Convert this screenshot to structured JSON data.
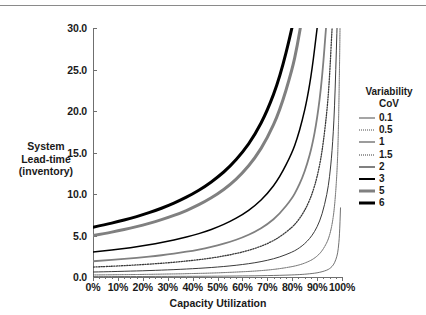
{
  "chart_data": {
    "type": "line",
    "title": "",
    "xlabel": "Capacity Utilization",
    "ylabel": "System Lead-time (inventory)",
    "ylabel_lines": [
      "System",
      "Lead-time",
      "(inventory)"
    ],
    "xlim": [
      0,
      100
    ],
    "ylim": [
      0,
      30
    ],
    "grid": false,
    "legend_position": "right",
    "legend_title_lines": [
      "Variability",
      "CoV"
    ],
    "x_tick_labels": [
      "0%",
      "10%",
      "20%",
      "30%",
      "40%",
      "50%",
      "60%",
      "70%",
      "80%",
      "90%",
      "100%"
    ],
    "x_tick_values": [
      0,
      10,
      20,
      30,
      40,
      50,
      60,
      70,
      80,
      90,
      100
    ],
    "y_tick_labels": [
      "0.0",
      "5.0",
      "10.0",
      "15.0",
      "20.0",
      "25.0",
      "30.0"
    ],
    "y_tick_values": [
      0,
      5,
      10,
      15,
      20,
      25,
      30
    ],
    "x": [
      0,
      5,
      10,
      15,
      20,
      25,
      30,
      35,
      40,
      45,
      50,
      55,
      60,
      65,
      70,
      75,
      80,
      82,
      84,
      86,
      88,
      90,
      92,
      94,
      95,
      96,
      97,
      98,
      98.5,
      99,
      99.4
    ],
    "series": [
      {
        "name": "0.1",
        "label": "0.1",
        "color": "#4d4d4d",
        "width": 0.8,
        "dash": "none",
        "intercept": 0.05,
        "values": [
          0.05,
          0.05,
          0.06,
          0.06,
          0.06,
          0.07,
          0.07,
          0.08,
          0.08,
          0.09,
          0.1,
          0.11,
          0.13,
          0.14,
          0.17,
          0.2,
          0.25,
          0.28,
          0.31,
          0.36,
          0.42,
          0.5,
          0.63,
          0.83,
          1.0,
          1.25,
          1.67,
          2.5,
          3.33,
          5.0,
          8.33
        ]
      },
      {
        "name": "0.5",
        "label": "0.5",
        "color": "#4d4d4d",
        "width": 0.9,
        "dash": "dotted",
        "intercept": 0.25,
        "values": [
          0.25,
          0.26,
          0.28,
          0.29,
          0.31,
          0.33,
          0.36,
          0.38,
          0.42,
          0.45,
          0.5,
          0.56,
          0.63,
          0.71,
          0.83,
          1.0,
          1.25,
          1.39,
          1.56,
          1.79,
          2.08,
          2.5,
          3.13,
          4.17,
          5.0,
          6.25,
          8.33,
          12.5,
          16.7,
          25.0,
          41.7
        ]
      },
      {
        "name": "1",
        "label": "1",
        "color": "#3a3a3a",
        "width": 1.0,
        "dash": "none",
        "intercept": 0.6,
        "values": [
          0.6,
          0.63,
          0.67,
          0.71,
          0.75,
          0.8,
          0.86,
          0.92,
          1.0,
          1.09,
          1.2,
          1.33,
          1.5,
          1.71,
          2.0,
          2.4,
          3.0,
          3.33,
          3.75,
          4.29,
          5.0,
          6.0,
          7.5,
          10.0,
          12.0,
          15.0,
          20.0,
          30.0,
          40.0,
          60.0,
          100.0
        ]
      },
      {
        "name": "1.5",
        "label": "1.5",
        "color": "#3a3a3a",
        "width": 1.3,
        "dash": "dotted",
        "intercept": 1.2,
        "values": [
          1.2,
          1.26,
          1.33,
          1.41,
          1.5,
          1.6,
          1.71,
          1.85,
          2.0,
          2.18,
          2.4,
          2.67,
          3.0,
          3.43,
          4.0,
          4.8,
          6.0,
          6.67,
          7.5,
          8.57,
          10.0,
          12.0,
          15.0,
          20.0,
          24.0,
          30.0,
          40.0,
          60.0,
          80.0,
          120.0,
          200.0
        ]
      },
      {
        "name": "2",
        "label": "2",
        "color": "#808080",
        "width": 1.8,
        "dash": "none",
        "intercept": 1.9,
        "values": [
          1.9,
          2.0,
          2.11,
          2.24,
          2.38,
          2.53,
          2.71,
          2.92,
          3.17,
          3.45,
          3.8,
          4.22,
          4.75,
          5.43,
          6.33,
          7.6,
          9.5,
          10.6,
          11.9,
          13.6,
          15.8,
          19.0,
          23.8,
          31.7,
          38.0,
          47.5,
          63.3,
          95.0,
          127.0,
          190.0,
          317.0
        ]
      },
      {
        "name": "3",
        "label": "3",
        "color": "#000000",
        "width": 1.5,
        "dash": "none",
        "intercept": 3.0,
        "values": [
          3.0,
          3.16,
          3.33,
          3.53,
          3.75,
          4.0,
          4.29,
          4.62,
          5.0,
          5.45,
          6.0,
          6.67,
          7.5,
          8.57,
          10.0,
          12.0,
          15.0,
          16.7,
          18.8,
          21.4,
          25.0,
          30.0,
          37.5,
          50.0,
          60.0,
          75.0,
          100.0,
          150.0,
          200.0,
          300.0,
          500.0
        ]
      },
      {
        "name": "5",
        "label": "5",
        "color": "#808080",
        "width": 3.0,
        "dash": "none",
        "intercept": 5.0,
        "values": [
          5.0,
          5.26,
          5.56,
          5.88,
          6.25,
          6.67,
          7.14,
          7.69,
          8.33,
          9.09,
          10.0,
          11.1,
          12.5,
          14.3,
          16.7,
          20.0,
          25.0,
          27.8,
          31.3,
          35.7,
          41.7,
          50.0,
          62.5,
          83.3,
          100.0,
          125.0,
          167.0,
          250.0,
          333.0,
          500.0,
          833.0
        ]
      },
      {
        "name": "6",
        "label": "6",
        "color": "#000000",
        "width": 3.0,
        "dash": "none",
        "intercept": 6.0,
        "values": [
          6.0,
          6.32,
          6.67,
          7.06,
          7.5,
          8.0,
          8.57,
          9.23,
          10.0,
          10.9,
          12.0,
          13.3,
          15.0,
          17.1,
          20.0,
          24.0,
          30.0,
          33.3,
          37.5,
          42.9,
          50.0,
          60.0,
          75.0,
          100.0,
          120.0,
          150.0,
          200.0,
          300.0,
          400.0,
          600.0,
          1000.0
        ]
      }
    ]
  },
  "axes": {
    "x_title": "Capacity Utilization",
    "y_title_line1": "System",
    "y_title_line2": "Lead-time",
    "y_title_line3": "(inventory)"
  },
  "legend": {
    "title_line1": "Variability",
    "title_line2": "CoV"
  },
  "colors": {
    "axis": "#6f6f6f",
    "text": "#1a1a1a",
    "rule": "#8a8a8a",
    "black_curve": "#000000",
    "grey_curve": "#808080",
    "thin_curve": "#3a3a3a",
    "background": "#ffffff"
  }
}
